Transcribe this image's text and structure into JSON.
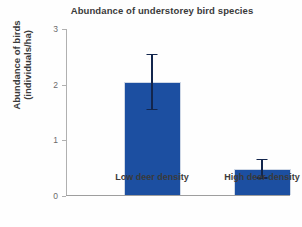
{
  "chart_data": {
    "type": "bar",
    "title": "Abundance of understorey bird species",
    "xlabel": "",
    "ylabel_line1": "Abundance of birds",
    "ylabel_line2": "(individuals/ha)",
    "categories": [
      "Low deer density",
      "High deer density"
    ],
    "values": [
      2.03,
      0.47
    ],
    "errors": [
      0.51,
      0.18
    ],
    "error_upper": [
      2.54,
      0.65
    ],
    "error_lower": [
      1.52,
      0.29
    ],
    "yticks": [
      0,
      1,
      2,
      3
    ],
    "yticklabels": [
      "0",
      "1",
      "2",
      "3"
    ],
    "ylim": [
      0,
      3
    ],
    "grid": false,
    "legend": false,
    "bar_color": "#1c4fa1",
    "error_color": "#13264d",
    "axis_color": "#9e9e9e",
    "text_color": "#3a3a3a",
    "background": "#ffffff"
  }
}
